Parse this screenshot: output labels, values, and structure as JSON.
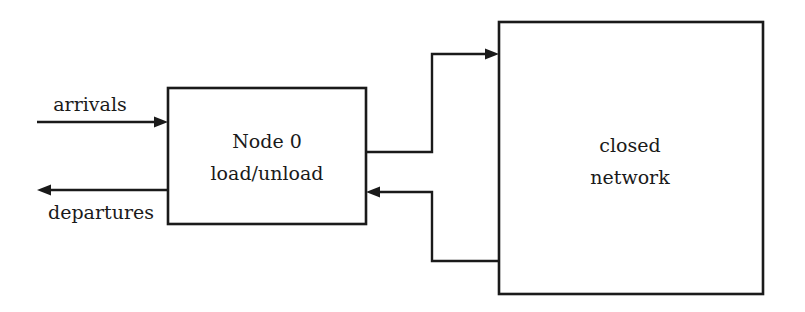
{
  "diagram": {
    "type": "block-flow",
    "colors": {
      "stroke": "#1a1a1a",
      "background": "#ffffff"
    },
    "nodes": {
      "node0": {
        "line1": "Node 0",
        "line2": "load/unload"
      },
      "network": {
        "line1": "closed",
        "line2": "network"
      }
    },
    "edges": {
      "arrivals": "arrivals",
      "departures": "departures",
      "to_network": "",
      "from_network": ""
    }
  }
}
